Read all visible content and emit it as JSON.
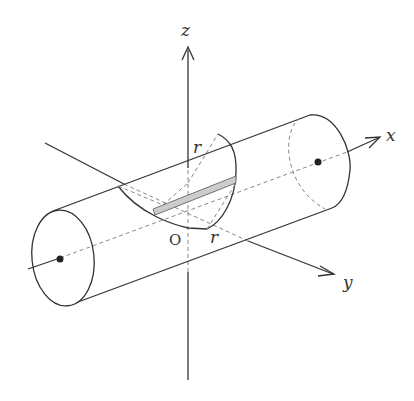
{
  "diagram": {
    "type": "3d-geometry",
    "axes": {
      "x": {
        "label": "x"
      },
      "y": {
        "label": "y"
      },
      "z": {
        "label": "z"
      }
    },
    "origin_label": "O",
    "radius_labels": [
      "r",
      "r"
    ],
    "colors": {
      "line": "#333333",
      "dashed": "#888888",
      "strip": "#cccccc"
    }
  }
}
